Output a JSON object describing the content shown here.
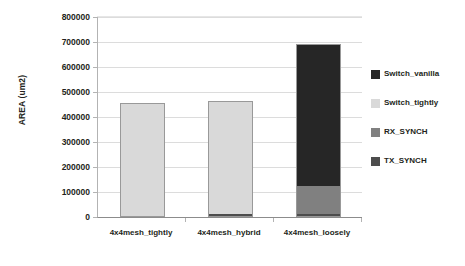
{
  "chart_data": {
    "type": "bar",
    "stacked": true,
    "title": "",
    "xlabel": "",
    "ylabel": "AREA (um2)",
    "categories": [
      "4x4mesh_tightly",
      "4x4mesh_hybrid",
      "4x4mesh_loosely"
    ],
    "series": [
      {
        "name": "TX_SYNCH",
        "color": "#4d4d4d",
        "values": [
          4000,
          14000,
          11000
        ]
      },
      {
        "name": "RX_SYNCH",
        "color": "#808080",
        "values": [
          0,
          0,
          115000
        ]
      },
      {
        "name": "Switch_tightly",
        "color": "#d9d9d9",
        "values": [
          452000,
          450000,
          0
        ]
      },
      {
        "name": "Switch_vanilla",
        "color": "#262626",
        "values": [
          0,
          0,
          566000
        ]
      }
    ],
    "totals": [
      456000,
      464000,
      692000
    ],
    "ylim": [
      0,
      800000
    ],
    "yticks": [
      0,
      100000,
      200000,
      300000,
      400000,
      500000,
      600000,
      700000,
      800000
    ],
    "ytick_labels": [
      "0",
      "100000",
      "200000",
      "300000",
      "400000",
      "500000",
      "600000",
      "700000",
      "800000"
    ],
    "grid": true,
    "grid_axis": "y",
    "legend_position": "right",
    "legend": [
      {
        "label": "Switch_vanilla",
        "color": "#262626"
      },
      {
        "label": "Switch_tightly",
        "color": "#d9d9d9"
      },
      {
        "label": "RX_SYNCH",
        "color": "#808080"
      },
      {
        "label": "TX_SYNCH",
        "color": "#4d4d4d"
      }
    ]
  },
  "axes": {
    "y_title": "AREA (um2)"
  }
}
